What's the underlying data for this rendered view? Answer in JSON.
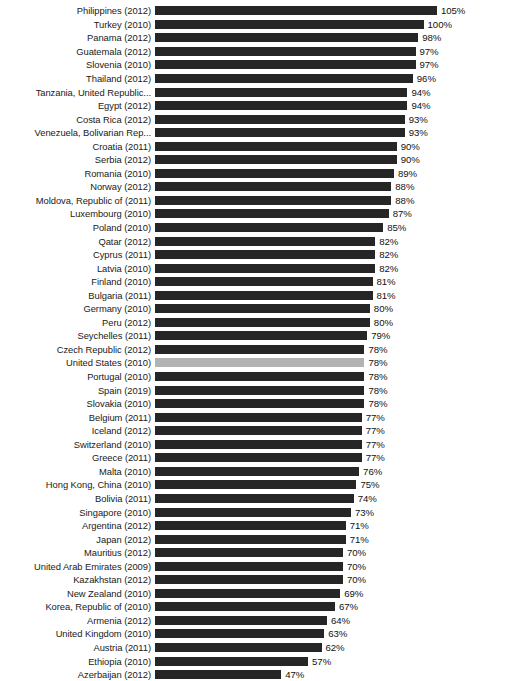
{
  "chart_data": {
    "type": "bar",
    "orientation": "horizontal",
    "title": "",
    "subtitle": "",
    "xlabel": "",
    "ylabel": "",
    "grid": false,
    "legend": null,
    "axis_visible": false,
    "value_suffix": "%",
    "xlim": [
      0,
      105
    ],
    "bar_color": "#262626",
    "highlight_color": "#b3b3b3",
    "highlighted_categories": [
      "United States (2010)"
    ],
    "categories": [
      "Philippines (2012)",
      "Turkey (2010)",
      "Panama (2012)",
      "Guatemala (2012)",
      "Slovenia (2010)",
      "Thailand (2012)",
      "Tanzania, United Republic...",
      "Egypt (2012)",
      "Costa Rica (2012)",
      "Venezuela, Bolivarian Rep...",
      "Croatia (2011)",
      "Serbia (2012)",
      "Romania (2010)",
      "Norway (2012)",
      "Moldova, Republic of (2011)",
      "Luxembourg (2010)",
      "Poland (2010)",
      "Qatar (2012)",
      "Cyprus (2011)",
      "Latvia (2010)",
      "Finland (2010)",
      "Bulgaria (2011)",
      "Germany (2010)",
      "Peru (2012)",
      "Seychelles (2011)",
      "Czech Republic (2012)",
      "United States (2010)",
      "Portugal (2010)",
      "Spain (2019)",
      "Slovakia (2010)",
      "Belgium (2011)",
      "Iceland (2012)",
      "Switzerland (2010)",
      "Greece (2011)",
      "Malta (2010)",
      "Hong Kong, China (2010)",
      "Bolivia (2011)",
      "Singapore (2010)",
      "Argentina (2012)",
      "Japan (2012)",
      "Mauritius (2012)",
      "United Arab Emirates (2009)",
      "Kazakhstan (2012)",
      "New Zealand (2010)",
      "Korea, Republic of (2010)",
      "Armenia (2012)",
      "United Kingdom (2010)",
      "Austria (2011)",
      "Ethiopia (2010)",
      "Azerbaijan (2012)"
    ],
    "values": [
      105,
      100,
      98,
      97,
      97,
      96,
      94,
      94,
      93,
      93,
      90,
      90,
      89,
      88,
      88,
      87,
      85,
      82,
      82,
      82,
      81,
      81,
      80,
      80,
      79,
      78,
      78,
      78,
      78,
      78,
      77,
      77,
      77,
      77,
      76,
      75,
      74,
      73,
      71,
      71,
      70,
      70,
      70,
      69,
      67,
      64,
      63,
      62,
      57,
      47
    ],
    "value_labels": [
      "105%",
      "100%",
      "98%",
      "97%",
      "97%",
      "96%",
      "94%",
      "94%",
      "93%",
      "93%",
      "90%",
      "90%",
      "89%",
      "88%",
      "88%",
      "87%",
      "85%",
      "82%",
      "82%",
      "82%",
      "81%",
      "81%",
      "80%",
      "80%",
      "79%",
      "78%",
      "78%",
      "78%",
      "78%",
      "78%",
      "77%",
      "77%",
      "77%",
      "77%",
      "76%",
      "75%",
      "74%",
      "73%",
      "71%",
      "71%",
      "70%",
      "70%",
      "70%",
      "69%",
      "67%",
      "64%",
      "63%",
      "62%",
      "57%",
      "47%"
    ]
  }
}
